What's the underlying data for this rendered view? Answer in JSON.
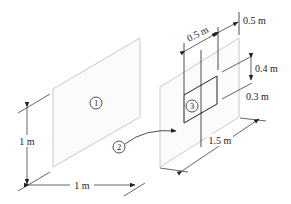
{
  "diagram": {
    "type": "isometric view-factor geometry",
    "surfaces": [
      {
        "id": "1",
        "label": "1",
        "description": "left square plate, 1 m x 1 m"
      },
      {
        "id": "2",
        "label": "2",
        "description": "right plate, 1.5 m wide, with window removed"
      },
      {
        "id": "3",
        "label": "3",
        "description": "rectangular window in plate 2"
      }
    ],
    "dimensions": {
      "plate1_height": "1 m",
      "plate1_width": "1 m",
      "plate2_width": "1.5 m",
      "window_width": "0.5 m",
      "window_offset_right": "0.5 m",
      "window_height": "0.4 m",
      "window_offset_bottom": "0.3 m"
    },
    "colors": {
      "plate_edge": "#c8c8c8",
      "plate_fill": "#fbfbfb",
      "line": "#222222"
    }
  }
}
